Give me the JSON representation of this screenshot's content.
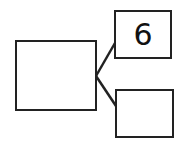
{
  "diagram": {
    "type": "number-bond",
    "whole": {
      "value": ""
    },
    "parts": [
      {
        "value": "6"
      },
      {
        "value": ""
      }
    ],
    "stroke_color": "#222222"
  }
}
